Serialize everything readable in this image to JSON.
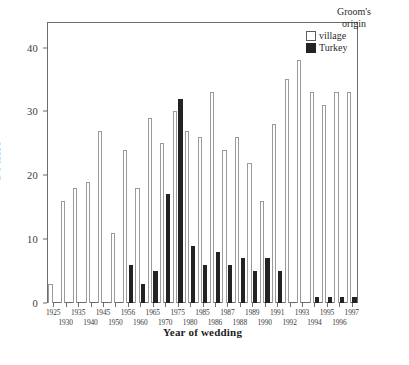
{
  "chart_data": {
    "type": "bar",
    "title": "",
    "xlabel": "Year of wedding",
    "ylabel": "Count",
    "ylim": [
      0,
      44
    ],
    "y_ticks": [
      0,
      10,
      20,
      30,
      40
    ],
    "grid": false,
    "legend_position": "top-right",
    "legend_title_lines": [
      "Groom's",
      "origin"
    ],
    "series": [
      {
        "name": "village",
        "style": "white-outlined",
        "color": "#ffffff",
        "edge_color": "#9a9a9a",
        "values": [
          3,
          16,
          18,
          19,
          27,
          11,
          24,
          18,
          29,
          25,
          30,
          27,
          26,
          33,
          24,
          26,
          22,
          16,
          28,
          35,
          38,
          33,
          31,
          33,
          33
        ]
      },
      {
        "name": "Turkey",
        "style": "black-filled",
        "color": "#232323",
        "edge_color": "#232323",
        "values": [
          0,
          0,
          0,
          0,
          0,
          0,
          6,
          3,
          5,
          17,
          32,
          9,
          6,
          8,
          6,
          7,
          5,
          7,
          5,
          0,
          0,
          1,
          1,
          1,
          1
        ]
      }
    ],
    "categories": [
      "1925",
      "1930",
      "1935",
      "1940",
      "1945",
      "1950",
      "1956",
      "1960",
      "1965",
      "1970",
      "1975",
      "1980",
      "1985",
      "1986",
      "1987",
      "1988",
      "1989",
      "1990",
      "1991",
      "1992",
      "1993",
      "1994",
      "1995",
      "1996",
      "1997"
    ],
    "x_tick_labels": [
      {
        "text": "1925",
        "row": 0
      },
      {
        "text": "1930",
        "row": 1
      },
      {
        "text": "1935",
        "row": 0
      },
      {
        "text": "1940",
        "row": 1
      },
      {
        "text": "1945",
        "row": 0
      },
      {
        "text": "1950",
        "row": 1
      },
      {
        "text": "1956",
        "row": 0
      },
      {
        "text": "1960",
        "row": 1
      },
      {
        "text": "1965",
        "row": 0
      },
      {
        "text": "1970",
        "row": 1
      },
      {
        "text": "1975",
        "row": 0
      },
      {
        "text": "1980",
        "row": 1
      },
      {
        "text": "1985",
        "row": 0
      },
      {
        "text": "1986",
        "row": 1
      },
      {
        "text": "1987",
        "row": 0
      },
      {
        "text": "1988",
        "row": 1
      },
      {
        "text": "1989",
        "row": 0
      },
      {
        "text": "1990",
        "row": 1
      },
      {
        "text": "1991",
        "row": 0
      },
      {
        "text": "1992",
        "row": 1
      },
      {
        "text": "1993",
        "row": 0
      },
      {
        "text": "1994",
        "row": 1
      },
      {
        "text": "1995",
        "row": 0
      },
      {
        "text": "1996",
        "row": 1
      },
      {
        "text": "1997",
        "row": 0
      }
    ]
  },
  "axes": {
    "y_title": "Count",
    "x_title": "Year of wedding"
  },
  "legend": {
    "title_line1": "Groom's",
    "title_line2": "origin",
    "items": [
      {
        "label": "village",
        "swatch": "village"
      },
      {
        "label": "Turkey",
        "swatch": "turkey"
      }
    ]
  }
}
